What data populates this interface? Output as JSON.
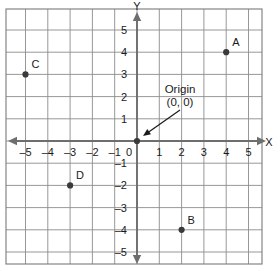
{
  "figure": {
    "axis_labels": {
      "x": "X",
      "y": "Y"
    },
    "colors": {
      "grid": "#8c8c8c",
      "axis": "#6e6e6e",
      "point": "#3a3a3a",
      "text": "#1a1a1a",
      "background": "#ffffff",
      "border": "#7a7a7a"
    }
  },
  "annotation": {
    "line1": "Origin",
    "line2": "(0, 0)",
    "arrow_from": [
      180,
      110
    ],
    "arrow_to": [
      143,
      136
    ]
  },
  "chart_data": {
    "type": "scatter",
    "title": "",
    "xlabel": "X",
    "ylabel": "Y",
    "xlim": [
      -5.9,
      5.6
    ],
    "ylim": [
      -5.5,
      5.9
    ],
    "grid": true,
    "legend": "none",
    "xticks": [
      -5,
      -4,
      -3,
      -2,
      -1,
      0,
      1,
      2,
      3,
      4,
      5
    ],
    "yticks": [
      -5,
      -4,
      -3,
      -2,
      -1,
      1,
      2,
      3,
      4,
      5
    ],
    "xtick_labels": [
      "–5",
      "–4",
      "–3",
      "–2",
      "–1",
      "0",
      "1",
      "2",
      "3",
      "4",
      "5"
    ],
    "ytick_labels": [
      "–5",
      "–4",
      "–3",
      "–2",
      "–1",
      "1",
      "2",
      "3",
      "4",
      "5"
    ],
    "origin_label": "0",
    "points": [
      {
        "label": "A",
        "x": 4,
        "y": 4
      },
      {
        "label": "B",
        "x": 2,
        "y": -4
      },
      {
        "label": "C",
        "x": -5,
        "y": 3
      },
      {
        "label": "D",
        "x": -3,
        "y": -2
      }
    ]
  }
}
